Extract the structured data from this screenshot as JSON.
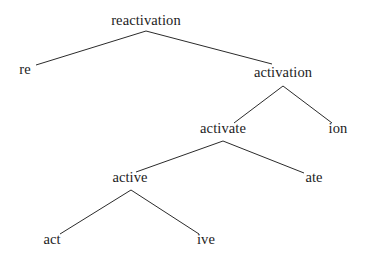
{
  "figure": {
    "kind": "morphological-derivation-tree",
    "word": "reactivation",
    "background_color": "#ffffff",
    "line_color": "#2b2b2b",
    "text_color": "#1c1c1c"
  },
  "nodes": [
    {
      "id": "reactivation",
      "label": "reactivation",
      "x": 146,
      "y": 27,
      "level": 0,
      "role": "root"
    },
    {
      "id": "re",
      "label": "re",
      "x": 25,
      "y": 76,
      "level": 1,
      "role": "leaf-prefix"
    },
    {
      "id": "activation",
      "label": "activation",
      "x": 283,
      "y": 79,
      "level": 1,
      "role": "internal"
    },
    {
      "id": "activate",
      "label": "activate",
      "x": 223,
      "y": 135,
      "level": 2,
      "role": "internal"
    },
    {
      "id": "ion",
      "label": "ion",
      "x": 338,
      "y": 135,
      "level": 2,
      "role": "leaf-suffix"
    },
    {
      "id": "active",
      "label": "active",
      "x": 130,
      "y": 184,
      "level": 3,
      "role": "internal"
    },
    {
      "id": "ate",
      "label": "ate",
      "x": 314,
      "y": 184,
      "level": 3,
      "role": "leaf-suffix"
    },
    {
      "id": "act",
      "label": "act",
      "x": 52,
      "y": 246,
      "level": 4,
      "role": "leaf-root"
    },
    {
      "id": "ive",
      "label": "ive",
      "x": 206,
      "y": 246,
      "level": 4,
      "role": "leaf-suffix"
    }
  ],
  "edges": [
    {
      "id": "reactivation-re",
      "from": "reactivation",
      "to": "re",
      "x1": 146,
      "y1": 31,
      "x2": 36,
      "y2": 65
    },
    {
      "id": "reactivation-activation",
      "from": "reactivation",
      "to": "activation",
      "x1": 146,
      "y1": 31,
      "x2": 272,
      "y2": 64
    },
    {
      "id": "activation-activate",
      "from": "activation",
      "to": "activate",
      "x1": 283,
      "y1": 86,
      "x2": 234,
      "y2": 123
    },
    {
      "id": "activation-ion",
      "from": "activation",
      "to": "ion",
      "x1": 283,
      "y1": 86,
      "x2": 332,
      "y2": 123
    },
    {
      "id": "activate-active",
      "from": "activate",
      "to": "active",
      "x1": 223,
      "y1": 141,
      "x2": 136,
      "y2": 172
    },
    {
      "id": "activate-ate",
      "from": "activate",
      "to": "ate",
      "x1": 223,
      "y1": 141,
      "x2": 304,
      "y2": 173
    },
    {
      "id": "active-act",
      "from": "active",
      "to": "act",
      "x1": 131,
      "y1": 190,
      "x2": 60,
      "y2": 234
    },
    {
      "id": "active-ive",
      "from": "active",
      "to": "ive",
      "x1": 131,
      "y1": 190,
      "x2": 199,
      "y2": 234
    }
  ]
}
